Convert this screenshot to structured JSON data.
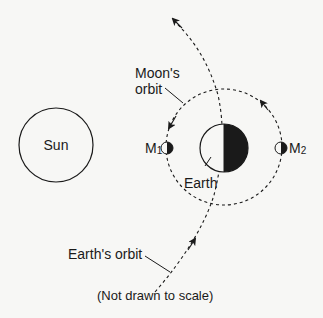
{
  "diagram": {
    "labels": {
      "sun": "Sun",
      "earth": "Earth",
      "moons_orbit_line1": "Moon's",
      "moons_orbit_line2": "orbit",
      "earths_orbit": "Earth's orbit",
      "moon1_letter": "M",
      "moon1_sub": "1",
      "moon2_letter": "M",
      "moon2_sub": "2",
      "note": "(Not drawn to scale)"
    },
    "colors": {
      "stroke": "#1a1a1a",
      "shadow": "#1a1a1a",
      "background": "#f7f7f5"
    }
  }
}
